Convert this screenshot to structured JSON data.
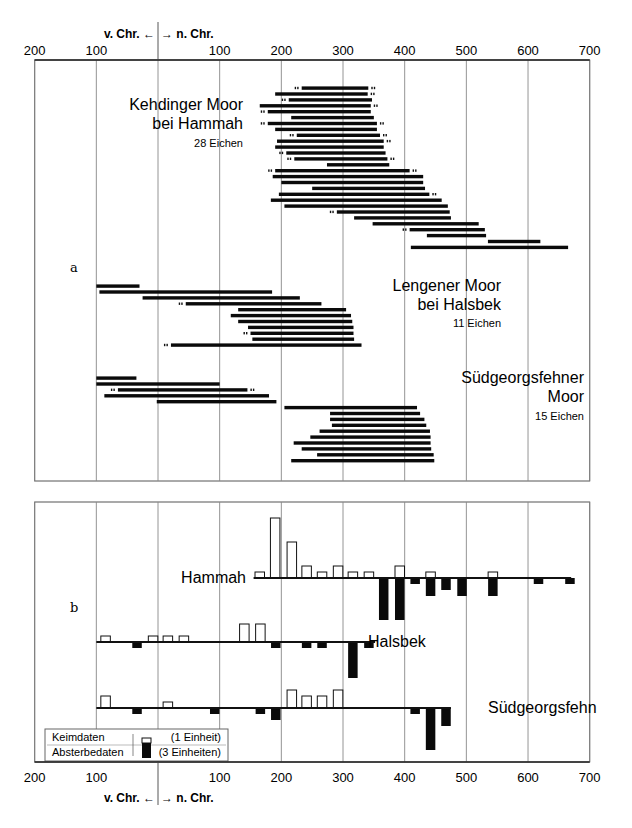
{
  "chart_data": [
    {
      "type": "bar",
      "subtype": "range-timeline",
      "panel_label": "a",
      "x_axis": {
        "ticks": [
          -200,
          -100,
          0,
          100,
          200,
          300,
          400,
          500,
          600,
          700
        ],
        "tick_labels": [
          "200",
          "100",
          "",
          "100",
          "200",
          "300",
          "400",
          "500",
          "600",
          "700"
        ],
        "era_label_left": "v. Chr. ←",
        "era_label_right": "→ n. Chr.",
        "xlim": [
          -200,
          700
        ]
      },
      "grid": true,
      "groups": [
        {
          "name": "Kehdinger Moor bei Hammah",
          "label_lines": [
            "Kehdinger Moor",
            "bei Hammah"
          ],
          "count_label": "28 Eichen",
          "bars": [
            {
              "start": 233,
              "end": 341,
              "tick_start": true,
              "tick_end": true
            },
            {
              "start": 190,
              "end": 340,
              "tick_end": true
            },
            {
              "start": 212,
              "end": 347,
              "tick_start": true
            },
            {
              "start": 165,
              "end": 345,
              "tick_end": true
            },
            {
              "start": 178,
              "end": 345,
              "tick_start": true
            },
            {
              "start": 216,
              "end": 350
            },
            {
              "start": 178,
              "end": 355,
              "tick_start": true,
              "tick_end": true
            },
            {
              "start": 190,
              "end": 355
            },
            {
              "start": 225,
              "end": 360,
              "tick_start": true,
              "tick_end": true
            },
            {
              "start": 193,
              "end": 366,
              "tick_end": true
            },
            {
              "start": 190,
              "end": 366
            },
            {
              "start": 208,
              "end": 369,
              "tick_start": true
            },
            {
              "start": 221,
              "end": 372,
              "tick_start": true,
              "tick_end": true
            },
            {
              "start": 274,
              "end": 375
            },
            {
              "start": 190,
              "end": 408,
              "tick_start": true,
              "tick_end": true
            },
            {
              "start": 186,
              "end": 430
            },
            {
              "start": 200,
              "end": 430
            },
            {
              "start": 250,
              "end": 433
            },
            {
              "start": 196,
              "end": 440,
              "tick_end": true
            },
            {
              "start": 183,
              "end": 460
            },
            {
              "start": 205,
              "end": 470
            },
            {
              "start": 290,
              "end": 473,
              "tick_start": true
            },
            {
              "start": 318,
              "end": 475
            },
            {
              "start": 348,
              "end": 520
            },
            {
              "start": 408,
              "end": 530,
              "tick_start": true
            },
            {
              "start": 436,
              "end": 532
            },
            {
              "start": 535,
              "end": 620
            },
            {
              "start": 410,
              "end": 665
            }
          ]
        },
        {
          "name": "Lengener Moor bei Halsbek",
          "label_lines": [
            "Lengener Moor",
            "bei Halsbek"
          ],
          "count_label": "11 Eichen",
          "bars": [
            {
              "start": -100,
              "end": -30
            },
            {
              "start": -95,
              "end": 185
            },
            {
              "start": -25,
              "end": 230
            },
            {
              "start": 45,
              "end": 265,
              "tick_start": true
            },
            {
              "start": 130,
              "end": 305
            },
            {
              "start": 118,
              "end": 313
            },
            {
              "start": 130,
              "end": 315
            },
            {
              "start": 146,
              "end": 317
            },
            {
              "start": 150,
              "end": 317,
              "tick_start": true
            },
            {
              "start": 153,
              "end": 318
            },
            {
              "start": 21,
              "end": 330,
              "tick_start": true
            }
          ]
        },
        {
          "name": "Südgeorgsfehner Moor",
          "label_lines": [
            "Südgeorgsfehner",
            "Moor"
          ],
          "count_label": "15 Eichen",
          "bars": [
            {
              "start": -100,
              "end": -35
            },
            {
              "start": -100,
              "end": 100
            },
            {
              "start": -65,
              "end": 145,
              "tick_start": true,
              "tick_end": true
            },
            {
              "start": -87,
              "end": 180
            },
            {
              "start": -2,
              "end": 192
            },
            {
              "start": 205,
              "end": 420
            },
            {
              "start": 279,
              "end": 425
            },
            {
              "start": 279,
              "end": 432
            },
            {
              "start": 282,
              "end": 435
            },
            {
              "start": 262,
              "end": 441
            },
            {
              "start": 247,
              "end": 442
            },
            {
              "start": 220,
              "end": 442
            },
            {
              "start": 233,
              "end": 443
            },
            {
              "start": 258,
              "end": 447
            },
            {
              "start": 216,
              "end": 448
            }
          ]
        }
      ]
    },
    {
      "type": "bar",
      "subtype": "diverging-histogram",
      "panel_label": "b",
      "bin_width_years": 25,
      "x_axis": {
        "ticks": [
          -200,
          -100,
          0,
          100,
          200,
          300,
          400,
          500,
          600,
          700
        ],
        "tick_labels": [
          "200",
          "100",
          "",
          "100",
          "200",
          "300",
          "400",
          "500",
          "600",
          "700"
        ],
        "era_label_left": "v. Chr. ←",
        "era_label_right": "→ n. Chr.",
        "xlim": [
          -200,
          700
        ]
      },
      "grid": true,
      "legend": {
        "items": [
          {
            "label": "Keimdaten",
            "fill": "white",
            "note": "(1 Einheit)"
          },
          {
            "label": "Absterbedaten",
            "fill": "black",
            "note": "(3 Einheiten)"
          }
        ],
        "position": "bottom-left"
      },
      "series": [
        {
          "name": "Hammah",
          "baseline_range": [
            155,
            670
          ],
          "keimdaten": [
            {
              "year": 165,
              "units": 1
            },
            {
              "year": 190,
              "units": 10
            },
            {
              "year": 217,
              "units": 6
            },
            {
              "year": 241,
              "units": 2
            },
            {
              "year": 266,
              "units": 1
            },
            {
              "year": 292,
              "units": 2
            },
            {
              "year": 316,
              "units": 1
            },
            {
              "year": 342,
              "units": 1
            },
            {
              "year": 392,
              "units": 2
            },
            {
              "year": 442,
              "units": 1
            },
            {
              "year": 543,
              "units": 1
            }
          ],
          "absterbedaten": [
            {
              "year": 366,
              "units": 7
            },
            {
              "year": 392,
              "units": 7
            },
            {
              "year": 417,
              "units": 1
            },
            {
              "year": 442,
              "units": 3
            },
            {
              "year": 467,
              "units": 2
            },
            {
              "year": 493,
              "units": 3
            },
            {
              "year": 543,
              "units": 3
            },
            {
              "year": 617,
              "units": 1
            },
            {
              "year": 668,
              "units": 1
            }
          ]
        },
        {
          "name": "Halsbek",
          "baseline_range": [
            -100,
            352
          ],
          "keimdaten": [
            {
              "year": -85,
              "units": 1
            },
            {
              "year": -8,
              "units": 1
            },
            {
              "year": 16,
              "units": 1
            },
            {
              "year": 42,
              "units": 1
            },
            {
              "year": 140,
              "units": 3
            },
            {
              "year": 166,
              "units": 3
            }
          ],
          "absterbedaten": [
            {
              "year": -34,
              "units": 1
            },
            {
              "year": 191,
              "units": 1
            },
            {
              "year": 241,
              "units": 1
            },
            {
              "year": 266,
              "units": 1
            },
            {
              "year": 316,
              "units": 6
            },
            {
              "year": 342,
              "units": 1
            }
          ]
        },
        {
          "name": "Südgeorgsfehn",
          "baseline_range": [
            -100,
            475
          ],
          "keimdaten": [
            {
              "year": -85,
              "units": 2
            },
            {
              "year": 16,
              "units": 1
            },
            {
              "year": 217,
              "units": 3
            },
            {
              "year": 241,
              "units": 2
            },
            {
              "year": 266,
              "units": 2
            },
            {
              "year": 292,
              "units": 3
            }
          ],
          "absterbedaten": [
            {
              "year": -34,
              "units": 1
            },
            {
              "year": 92,
              "units": 1
            },
            {
              "year": 166,
              "units": 1
            },
            {
              "year": 191,
              "units": 2
            },
            {
              "year": 417,
              "units": 1
            },
            {
              "year": 442,
              "units": 7
            },
            {
              "year": 467,
              "units": 3
            }
          ]
        }
      ]
    }
  ],
  "figure": {
    "panel_a_label": "a",
    "panel_b_label": "b",
    "era_left": "v. Chr.",
    "era_right": "n. Chr.",
    "legend_keim": "Keimdaten",
    "legend_abst": "Absterbedaten",
    "legend_keim_note": "(1 Einheit)",
    "legend_abst_note": "(3 Einheiten)",
    "series_labels": [
      "Hammah",
      "Halsbek",
      "Südgeorgsfehn"
    ]
  }
}
